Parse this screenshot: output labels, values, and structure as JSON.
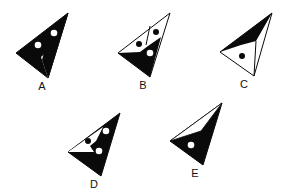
{
  "figure": {
    "colors": {
      "ink": "#0a0a0a",
      "paper": "#ffffff"
    },
    "options": [
      {
        "label": "A",
        "white_dots": 2,
        "black_dots": 1
      },
      {
        "label": "B",
        "white_dots": 1,
        "black_dots": 2
      },
      {
        "label": "C",
        "white_dots": 0,
        "black_dots": 1
      },
      {
        "label": "D",
        "white_dots": 2,
        "black_dots": 1
      },
      {
        "label": "E",
        "white_dots": 1,
        "black_dots": 0
      }
    ]
  }
}
